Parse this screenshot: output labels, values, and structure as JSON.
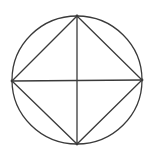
{
  "diagram": {
    "title": "",
    "stroke_color": "#3a3a3a",
    "background": "#ffffff",
    "circle": {
      "cx": 77,
      "cy": 80,
      "r": 64.5
    },
    "vertices": {
      "top": {
        "x": 77,
        "y": 16
      },
      "right": {
        "x": 142,
        "y": 80
      },
      "bottom": {
        "x": 77,
        "y": 144
      },
      "left": {
        "x": 12,
        "y": 81
      }
    },
    "labels": []
  }
}
